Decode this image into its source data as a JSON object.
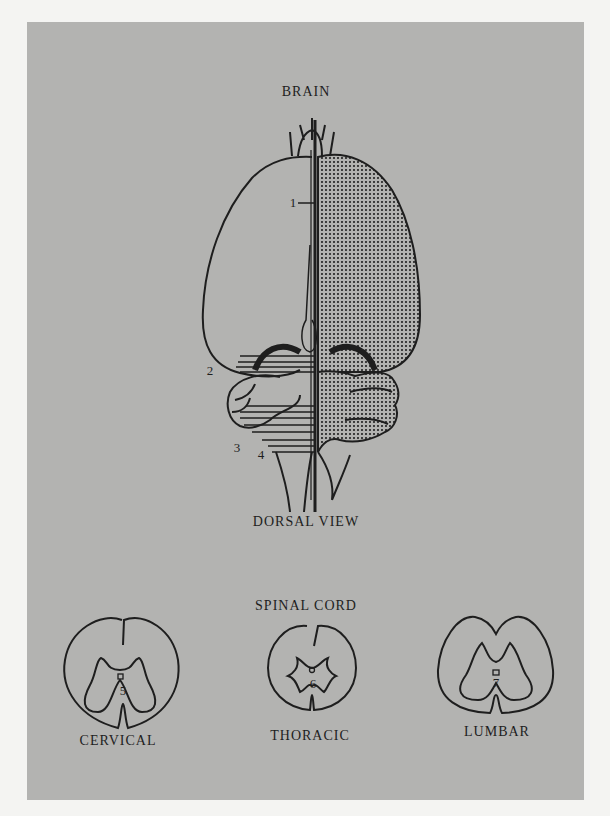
{
  "brain": {
    "title": "BRAIN",
    "view_label": "DORSAL VIEW",
    "markers": [
      {
        "id": "1",
        "label": "1"
      },
      {
        "id": "2",
        "label": "2"
      },
      {
        "id": "3",
        "label": "3"
      },
      {
        "id": "4",
        "label": "4"
      }
    ]
  },
  "spinal_cord": {
    "title": "SPINAL CORD",
    "sections": [
      {
        "name": "CERVICAL",
        "marker": "5"
      },
      {
        "name": "THORACIC",
        "marker": "6"
      },
      {
        "name": "LUMBAR",
        "marker": "7"
      }
    ]
  },
  "colors": {
    "background": "#b3b3b1",
    "ink": "#1e1e1e",
    "page": "#f4f4f2"
  }
}
